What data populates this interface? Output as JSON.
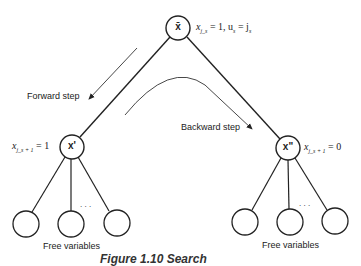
{
  "nodes": {
    "root": {
      "label": "x̄",
      "annotation": {
        "var": "x",
        "sub": "j_s",
        "rest": " = 1, u",
        "sub2": "s",
        "rest2": " = j",
        "sub3": "s"
      }
    },
    "left": {
      "label": "x'",
      "annotation": {
        "var": "x",
        "sub": "j_s + 1",
        "rest": " = 1"
      }
    },
    "right": {
      "label": "x\"",
      "annotation": {
        "var": "x",
        "sub": "j_s + 1",
        "rest": " = 0"
      }
    }
  },
  "edges_labels": {
    "forward": "Forward step",
    "backward": "Backward step"
  },
  "leaf_groups": {
    "left": {
      "label": "Free variables",
      "ellipsis": ". . ."
    },
    "right": {
      "label": "Free variables",
      "ellipsis": ". . ."
    }
  },
  "caption": "Figure 1.10   Search"
}
